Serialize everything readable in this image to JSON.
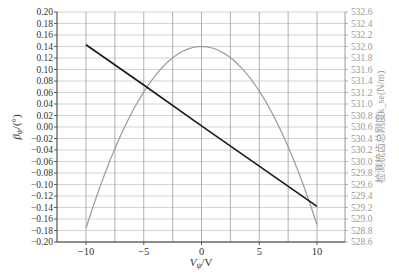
{
  "chart_data": {
    "type": "line",
    "title": "",
    "xlabel": "V_ψ/V",
    "ylabel_left": "β_ψ/(°)",
    "ylabel_right": "检测梳齿总刚度k_se(N/m)",
    "xlim": [
      -10,
      10
    ],
    "x_ticks": [
      -10,
      -5,
      0,
      5,
      10
    ],
    "x_tick_labels": [
      "−10",
      "−5",
      "0",
      "5",
      "10"
    ],
    "ylim_left": [
      -0.2,
      0.2
    ],
    "y_left_ticks": [
      "0.20",
      "0.18",
      "0.16",
      "0.14",
      "0.12",
      "0.10",
      "0.08",
      "0.06",
      "0.04",
      "0.02",
      "0.00",
      "−0.02",
      "−0.04",
      "−0.06",
      "−0.08",
      "−0.10",
      "−0.12",
      "−0.14",
      "−0.16",
      "−0.18",
      "−0.20"
    ],
    "ylim_right": [
      528.6,
      532.6
    ],
    "y_right_ticks": [
      "532.6",
      "532.4",
      "532.2",
      "532.0",
      "531.8",
      "531.6",
      "531.4",
      "531.2",
      "531.0",
      "530.8",
      "530.6",
      "530.4",
      "530.2",
      "530.0",
      "529.8",
      "529.6",
      "529.4",
      "529.2",
      "529.0",
      "528.8",
      "528.6"
    ],
    "grid": true,
    "legend": "none",
    "series": [
      {
        "name": "β_ψ",
        "axis": "left",
        "color": "#1a1a1a",
        "x": [
          -10,
          -5,
          0,
          5,
          10
        ],
        "values": [
          0.143,
          0.073,
          0.002,
          -0.068,
          -0.138
        ]
      },
      {
        "name": "k_se",
        "axis": "right",
        "color": "#9a9a9a",
        "x": [
          -10,
          -8,
          -6,
          -4,
          -2,
          0,
          2,
          4,
          6,
          8,
          10
        ],
        "values": [
          528.84,
          529.92,
          530.84,
          531.47,
          531.87,
          532.0,
          531.87,
          531.47,
          530.84,
          529.92,
          528.9
        ]
      }
    ]
  }
}
